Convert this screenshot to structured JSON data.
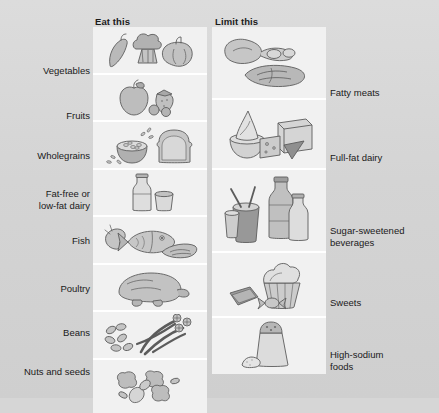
{
  "figure": {
    "title_eat": "Eat this",
    "title_limit": "Limit this",
    "type": "two-column comparison illustration",
    "background_color": "#d6d6d6",
    "panel_color": "#f1f1f1",
    "divider_color": "#ffffff",
    "text_color": "#1a1a1a"
  },
  "eat_column": {
    "header": "Eat this",
    "rows": [
      {
        "label": "Vegetables",
        "icon": "vegetables-icon"
      },
      {
        "label": "Fruits",
        "icon": "fruits-icon"
      },
      {
        "label": "Wholegrains",
        "icon": "wholegrains-icon"
      },
      {
        "label": "Fat-free or\nlow-fat dairy",
        "label_line1": "Fat-free or",
        "label_line2": "low-fat dairy",
        "icon": "low-fat-dairy-icon"
      },
      {
        "label": "Fish",
        "icon": "fish-icon"
      },
      {
        "label": "Poultry",
        "icon": "poultry-icon"
      },
      {
        "label": "Beans",
        "icon": "beans-icon"
      },
      {
        "label": "Nuts and seeds",
        "icon": "nuts-and-seeds-icon"
      }
    ]
  },
  "limit_column": {
    "header": "Limit this",
    "rows": [
      {
        "label": "Fatty meats",
        "icon": "fatty-meats-icon"
      },
      {
        "label": "Full-fat dairy",
        "icon": "full-fat-dairy-icon"
      },
      {
        "label_line1": "Sugar-sweetened",
        "label_line2": "beverages",
        "label": "Sugar-sweetened beverages",
        "icon": "sugary-beverages-icon"
      },
      {
        "label": "Sweets",
        "icon": "sweets-icon"
      },
      {
        "label_line1": "High-sodium",
        "label_line2": "foods",
        "label": "High-sodium foods",
        "icon": "high-sodium-foods-icon"
      }
    ]
  }
}
